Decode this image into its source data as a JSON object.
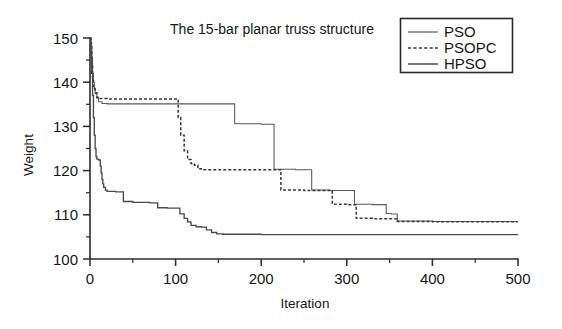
{
  "chart_data": {
    "type": "line",
    "title": "The 15-bar planar truss structure",
    "xlabel": "Iteration",
    "ylabel": "Weight",
    "xlim": [
      0,
      500
    ],
    "ylim": [
      100,
      150
    ],
    "xticks": [
      0,
      100,
      200,
      300,
      400,
      500
    ],
    "yticks": [
      100,
      110,
      120,
      130,
      140,
      150
    ],
    "xtick_minor": [
      50,
      150,
      250,
      350,
      450
    ],
    "ytick_minor": [
      105,
      115,
      125,
      135,
      145
    ],
    "grid": false,
    "legend_position": "top-right",
    "series": [
      {
        "name": "PSO",
        "style": "solid-thin",
        "color": "#5a5a5a",
        "points": [
          [
            0,
            150.0
          ],
          [
            1,
            149.0
          ],
          [
            2,
            145.5
          ],
          [
            3,
            142.0
          ],
          [
            4,
            140.0
          ],
          [
            5,
            138.5
          ],
          [
            6,
            137.4
          ],
          [
            8,
            136.4
          ],
          [
            10,
            135.6
          ],
          [
            14,
            135.2
          ],
          [
            20,
            135.1
          ],
          [
            60,
            135.1
          ],
          [
            120,
            135.1
          ],
          [
            168,
            135.1
          ],
          [
            169,
            130.6
          ],
          [
            200,
            130.5
          ],
          [
            214,
            130.5
          ],
          [
            215,
            120.3
          ],
          [
            240,
            120.2
          ],
          [
            258,
            120.2
          ],
          [
            259,
            115.6
          ],
          [
            280,
            115.5
          ],
          [
            300,
            115.5
          ],
          [
            308,
            115.5
          ],
          [
            309,
            112.4
          ],
          [
            330,
            112.3
          ],
          [
            345,
            112.3
          ],
          [
            346,
            110.3
          ],
          [
            352,
            110.2
          ],
          [
            358,
            110.2
          ],
          [
            359,
            108.6
          ],
          [
            400,
            108.5
          ],
          [
            450,
            108.5
          ],
          [
            500,
            108.5
          ]
        ]
      },
      {
        "name": "PSOPC",
        "style": "dashed",
        "color": "#3a3a3a",
        "points": [
          [
            0,
            150.0
          ],
          [
            1,
            148.0
          ],
          [
            2,
            144.0
          ],
          [
            3,
            141.0
          ],
          [
            4,
            139.0
          ],
          [
            6,
            137.6
          ],
          [
            8,
            136.6
          ],
          [
            12,
            136.3
          ],
          [
            20,
            136.2
          ],
          [
            60,
            136.2
          ],
          [
            100,
            136.2
          ],
          [
            102,
            136.2
          ],
          [
            103,
            132.0
          ],
          [
            106,
            128.0
          ],
          [
            110,
            124.5
          ],
          [
            114,
            122.5
          ],
          [
            118,
            121.6
          ],
          [
            122,
            121.2
          ],
          [
            126,
            120.4
          ],
          [
            130,
            120.2
          ],
          [
            160,
            120.2
          ],
          [
            200,
            120.2
          ],
          [
            222,
            120.2
          ],
          [
            223,
            115.6
          ],
          [
            250,
            115.5
          ],
          [
            282,
            115.5
          ],
          [
            283,
            112.4
          ],
          [
            300,
            112.3
          ],
          [
            310,
            112.3
          ],
          [
            311,
            109.2
          ],
          [
            330,
            109.1
          ],
          [
            358,
            109.1
          ],
          [
            359,
            108.5
          ],
          [
            400,
            108.4
          ],
          [
            450,
            108.4
          ],
          [
            500,
            108.4
          ]
        ]
      },
      {
        "name": "HPSO",
        "style": "solid",
        "color": "#4a4a4a",
        "points": [
          [
            0,
            150.0
          ],
          [
            1,
            147.0
          ],
          [
            2,
            142.0
          ],
          [
            3,
            137.0
          ],
          [
            4,
            132.0
          ],
          [
            5,
            128.0
          ],
          [
            6,
            125.0
          ],
          [
            7,
            123.2
          ],
          [
            8,
            122.6
          ],
          [
            10,
            122.4
          ],
          [
            12,
            121.0
          ],
          [
            13,
            119.5
          ],
          [
            14,
            118.0
          ],
          [
            15,
            117.0
          ],
          [
            16,
            116.2
          ],
          [
            18,
            115.6
          ],
          [
            20,
            115.3
          ],
          [
            30,
            115.2
          ],
          [
            38,
            115.2
          ],
          [
            39,
            113.0
          ],
          [
            50,
            112.8
          ],
          [
            70,
            112.7
          ],
          [
            78,
            112.7
          ],
          [
            79,
            111.6
          ],
          [
            90,
            111.5
          ],
          [
            104,
            111.5
          ],
          [
            105,
            110.2
          ],
          [
            110,
            109.2
          ],
          [
            114,
            108.4
          ],
          [
            118,
            107.6
          ],
          [
            124,
            107.3
          ],
          [
            130,
            107.2
          ],
          [
            136,
            106.6
          ],
          [
            142,
            106.0
          ],
          [
            148,
            105.7
          ],
          [
            155,
            105.6
          ],
          [
            200,
            105.5
          ],
          [
            300,
            105.5
          ],
          [
            400,
            105.5
          ],
          [
            500,
            105.5
          ]
        ]
      }
    ]
  },
  "legend": {
    "items": [
      {
        "label": "PSO"
      },
      {
        "label": "PSOPC"
      },
      {
        "label": "HPSO"
      }
    ]
  }
}
